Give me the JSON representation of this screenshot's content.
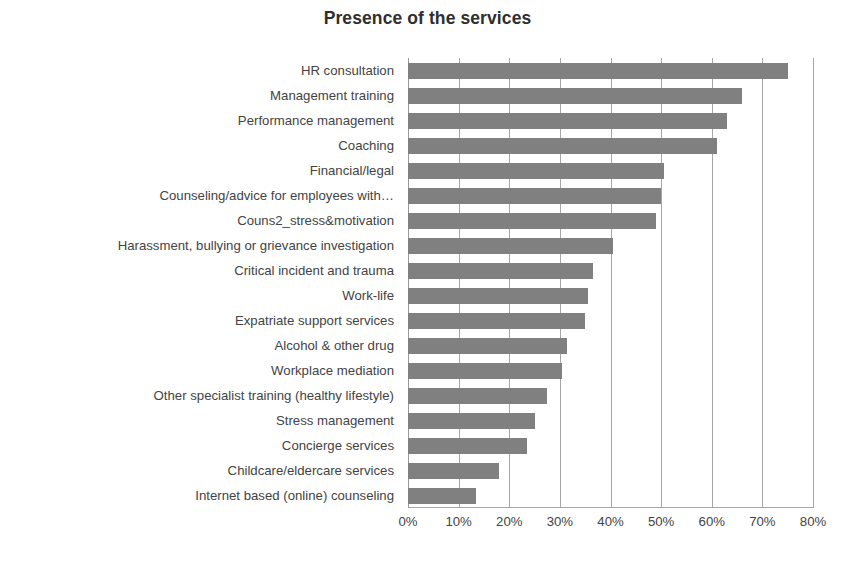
{
  "chart_data": {
    "type": "bar",
    "orientation": "horizontal",
    "title": "Presence of the services",
    "xlabel": "",
    "ylabel": "",
    "xlim": [
      0,
      80
    ],
    "xtick_labels": [
      "0%",
      "10%",
      "20%",
      "30%",
      "40%",
      "50%",
      "60%",
      "70%",
      "80%"
    ],
    "xtick_values": [
      0,
      10,
      20,
      30,
      40,
      50,
      60,
      70,
      80
    ],
    "grid": true,
    "grid_axis": "x",
    "legend": false,
    "bar_color": "#808080",
    "gridline_color": "#a6a6a6",
    "text_color": "#434343",
    "categories": [
      "HR consultation",
      "Management training",
      "Performance management",
      "Coaching",
      "Financial/legal",
      "Counseling/advice for employees with…",
      "Couns2_stress&motivation",
      "Harassment, bullying or grievance investigation",
      "Critical incident and trauma",
      "Work-life",
      "Expatriate support services",
      "Alcohol & other drug",
      "Workplace mediation",
      "Other specialist training (healthy lifestyle)",
      "Stress management",
      "Concierge services",
      "Childcare/eldercare services",
      "Internet based (online) counseling"
    ],
    "values": [
      75,
      66,
      63,
      61,
      50.5,
      50,
      49,
      40.5,
      36.5,
      35.5,
      35,
      31.5,
      30.5,
      27.5,
      25,
      23.5,
      18,
      13.5
    ],
    "value_labels": [
      "75%",
      "66%",
      "63%",
      "61%",
      "50.5%",
      "50%",
      "49%",
      "40.5%",
      "36.5%",
      "35.5%",
      "35%",
      "31.5%",
      "30.5%",
      "27.5%",
      "25%",
      "23.5%",
      "18%",
      "13.5%"
    ]
  }
}
